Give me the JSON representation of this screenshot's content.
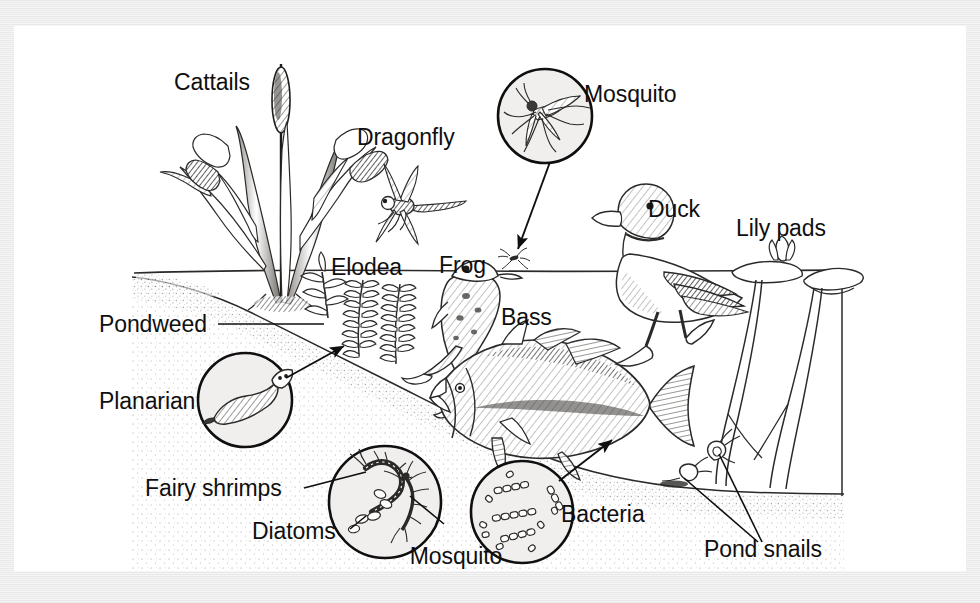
{
  "figure": {
    "background_color": "#eeeeee",
    "plate_color": "#ffffff",
    "ink_color": "#100f10",
    "magnifier_fill": "#f1efed"
  },
  "labels": {
    "cattails": "Cattails",
    "dragonfly": "Dragonfly",
    "mosquito": "Mosquito",
    "duck": "Duck",
    "lily_pads": "Lily pads",
    "elodea": "Elodea",
    "frog": "Frog",
    "bass": "Bass",
    "pondweed": "Pondweed",
    "planarian": "Planarian",
    "fairy_shrimps": "Fairy shrimps",
    "diatoms": "Diatoms",
    "mosquito_larvas_line1": "Mosquito",
    "mosquito_larvas_line2": "larvas",
    "bacteria": "Bacteria",
    "pond_snails": "Pond snails"
  },
  "organisms": [
    {
      "name": "Cattails",
      "zone": "emergent-above-water",
      "magnified": false
    },
    {
      "name": "Dragonfly",
      "zone": "air",
      "magnified": false
    },
    {
      "name": "Mosquito",
      "zone": "air",
      "magnified": true
    },
    {
      "name": "Duck",
      "zone": "surface",
      "magnified": false
    },
    {
      "name": "Lily pads",
      "zone": "surface",
      "magnified": false
    },
    {
      "name": "Elodea",
      "zone": "submerged",
      "magnified": false
    },
    {
      "name": "Frog",
      "zone": "surface",
      "magnified": false
    },
    {
      "name": "Bass",
      "zone": "submerged",
      "magnified": false
    },
    {
      "name": "Pondweed",
      "zone": "submerged",
      "magnified": false
    },
    {
      "name": "Planarian",
      "zone": "benthic",
      "magnified": true
    },
    {
      "name": "Fairy shrimps",
      "zone": "benthic",
      "magnified": true
    },
    {
      "name": "Diatoms",
      "zone": "benthic",
      "magnified": true
    },
    {
      "name": "Mosquito larvas",
      "zone": "benthic",
      "magnified": true
    },
    {
      "name": "Bacteria",
      "zone": "benthic",
      "magnified": true
    },
    {
      "name": "Pond snails",
      "zone": "benthic",
      "magnified": false
    }
  ]
}
